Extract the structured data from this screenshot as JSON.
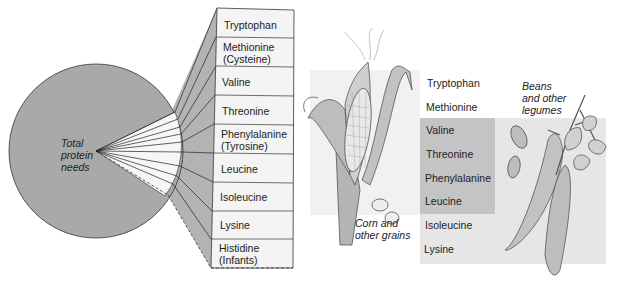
{
  "left_panel": {
    "pie_label": [
      "Total",
      "protein",
      "needs"
    ],
    "amino_acids": [
      {
        "line1": "Tryptophan",
        "line2": ""
      },
      {
        "line1": "Methionine",
        "line2": "(Cysteine)"
      },
      {
        "line1": "Valine",
        "line2": ""
      },
      {
        "line1": "Threonine",
        "line2": ""
      },
      {
        "line1": "Phenylalanine",
        "line2": "(Tyrosine)"
      },
      {
        "line1": "Leucine",
        "line2": ""
      },
      {
        "line1": "Isoleucine",
        "line2": ""
      },
      {
        "line1": "Lysine",
        "line2": ""
      },
      {
        "line1": "Histidine",
        "line2": "(Infants)"
      }
    ]
  },
  "right_panel": {
    "corn_caption": [
      "Corn and",
      "other grains"
    ],
    "beans_caption": [
      "Beans",
      "and other",
      "legumes"
    ],
    "amino_acids": [
      "Tryptophan",
      "Methionine",
      "Valine",
      "Threonine",
      "Phenylalanine",
      "Leucine",
      "Isoleucine",
      "Lysine"
    ],
    "shared_group": [
      "Valine",
      "Threonine",
      "Phenylalanine",
      "Leucine"
    ]
  },
  "colors": {
    "pie_fill": "#a9a9a9",
    "connector_fill": "#b3b3b3",
    "box_fill": "#f4f4f4",
    "legume_region": "#e6e6e6",
    "shared_region": "#c4c4c4",
    "grain_region": "#f0f0f0"
  }
}
